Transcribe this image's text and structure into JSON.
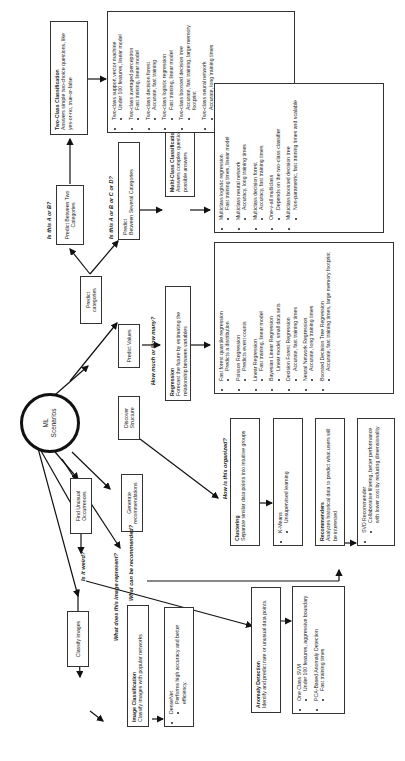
{
  "center": {
    "label_line1": "ML",
    "label_line2": "Scenarios"
  },
  "scenarios": {
    "predict_categories": "Predict categories",
    "predict_values": "Predict Values",
    "discover_structure": "Discover Structure",
    "generate_recommendations": "Generate recommendations",
    "find_unusual": "Find Unusual Occurrences",
    "classify_images": "Classify images"
  },
  "questions": {
    "two_class": "Is this A or B?",
    "multi_class": "Is this A or B or C or D?",
    "regression": "How much or How many?",
    "clustering": "How is this organized?",
    "recommend": "What can be recommended?",
    "anomaly": "Is it weird?",
    "image": "What does this image represent?"
  },
  "sub_scenarios": {
    "two_categories": "Predict Between Two Categories",
    "several_categories_line1": "Predict",
    "several_categories_line2": "Between Several Categories"
  },
  "categories": {
    "two_class": {
      "title": "Two-Class Classification",
      "desc": "Answers simple two-choice questions, like yes-or-no, true-or-false"
    },
    "multi_class": {
      "title": "Multi-Class Classification",
      "desc": "Answers complex questions with multiple possible answers"
    },
    "regression": {
      "title": "Regression",
      "desc": "Forecast the future by estimating the relationship between variables"
    },
    "clustering": {
      "title": "Clustering",
      "desc": "Separate similar data points into intuitive groups"
    },
    "recommenders": {
      "title": "Recommenders",
      "desc": "Analyzes historical data to predict what users will be interested"
    },
    "anomaly": {
      "title": "Anomaly Detection",
      "desc": "Identify and predict rare or unusual data points."
    },
    "image": {
      "title": "Image Classification",
      "desc": "Classify images with popular networks"
    }
  },
  "algorithms": {
    "two_class": [
      {
        "name": "Two-class support vector machine",
        "note": "Under 100 features, linear model"
      },
      {
        "name": "Two-class averaged perceptron",
        "note": "Fast training, linear model"
      },
      {
        "name": "Two-class decision forest",
        "note": "Accurate, fast training"
      },
      {
        "name": "Two-class logistic regression",
        "note": "Fast training, linear model"
      },
      {
        "name": "Two-class boosted decision tree",
        "note": "Accurate, fast training, large memory footprint"
      },
      {
        "name": "Two-class neural network",
        "note": "Accurate, long training times"
      }
    ],
    "multi_class": [
      {
        "name": "Multiclass logistic regression",
        "note": "Fast training times, linear model"
      },
      {
        "name": "Multiclass neural network",
        "note": "Accuracy, long training times"
      },
      {
        "name": "Multiclass decision forest",
        "note": "Accuracy, fast training times"
      },
      {
        "name": "One-v-all multiclass",
        "note": "Depends on the two-class classifier"
      },
      {
        "name": "Multiclass boosted decision tree",
        "note": "Non-parametric, fast training times and scalable"
      }
    ],
    "regression": [
      {
        "name": "Fast forest quantile regression",
        "note": "Predicts a distribution"
      },
      {
        "name": "Poisson Regression",
        "note": "Predicts event counts"
      },
      {
        "name": "Linear Regression",
        "note": "Fast training, linear model"
      },
      {
        "name": "Bayesian Linear Regression",
        "note": "Linear model, small data sets"
      },
      {
        "name": "Decision Forest Regression",
        "note": "Accurate, fast training times"
      },
      {
        "name": "Neural Network Regression",
        "note": "Accurate, long training times"
      },
      {
        "name": "Boosted Decision Tree Regression",
        "note": "Accurate, fast training times, large memory footprint"
      }
    ],
    "clustering": [
      {
        "name": "K-Means",
        "note": "Unsupervised learning"
      }
    ],
    "recommenders": [
      {
        "name": "SVD Recommender",
        "note": "Collaborative filtering, better performance with lower cost by reducing dimensionality"
      }
    ],
    "anomaly": [
      {
        "name": "One Class SVM",
        "note": "Under 100 features, aggressive boundary"
      },
      {
        "name": "PCA-Based Anomaly Detection",
        "note": "Fast training times"
      }
    ],
    "image": [
      {
        "name": "DenseNet",
        "note": "Performs high accuracy and better efficiency."
      }
    ]
  }
}
